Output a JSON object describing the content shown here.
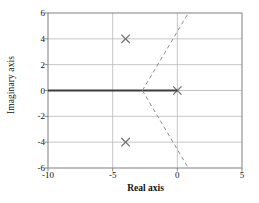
{
  "chart_data": {
    "type": "scatter",
    "title": "",
    "subtitle": "",
    "xlabel": "Real axis",
    "ylabel": "Imaginary axis",
    "xlim": [
      -10,
      5
    ],
    "ylim": [
      -6,
      6
    ],
    "xticks": [
      -10,
      -5,
      0,
      5
    ],
    "xticklabels": [
      "-10",
      "-5",
      "0",
      "5"
    ],
    "yticks": [
      -6,
      -4,
      -2,
      0,
      2,
      4,
      6
    ],
    "yticklabels": [
      "-6",
      "-4",
      "-2",
      "0",
      "2",
      "4",
      "6"
    ],
    "grid": true,
    "grid_color": "#b8b8b8",
    "legend": "none",
    "axis_color": "#8a8a8a",
    "series": [
      {
        "name": "poles",
        "marker": "x",
        "color": "#6e6e6e",
        "points": [
          {
            "x": -4.0,
            "y": 4.0
          },
          {
            "x": -4.0,
            "y": -4.0
          },
          {
            "x": 0.0,
            "y": 0.0
          }
        ]
      },
      {
        "name": "real-axis-locus",
        "style": "solid-thick",
        "color": "#3d3d3d",
        "points": [
          {
            "x": -10.0,
            "y": 0.0
          },
          {
            "x": 0.0,
            "y": 0.0
          }
        ]
      },
      {
        "name": "locus-branch-upper",
        "style": "dashed",
        "color": "#8e8e8e",
        "points": [
          {
            "x": -2.7,
            "y": 0.0
          },
          {
            "x": 0.85,
            "y": 6.0
          }
        ]
      },
      {
        "name": "locus-branch-lower",
        "style": "dashed",
        "color": "#8e8e8e",
        "points": [
          {
            "x": -2.7,
            "y": 0.0
          },
          {
            "x": 0.85,
            "y": -6.0
          }
        ]
      }
    ],
    "annotations": []
  },
  "axes": {
    "x_label": "Real axis",
    "y_label": "Imaginary axis"
  }
}
